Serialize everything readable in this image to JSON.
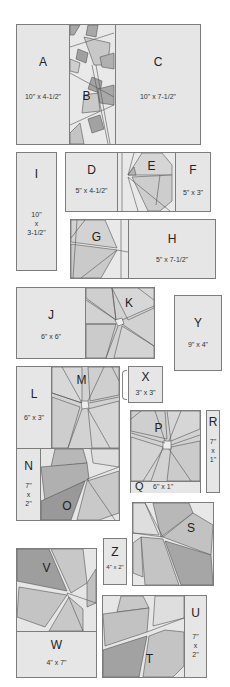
{
  "colors": {
    "plain_fabric": "#e6e6e6",
    "light_patch": "#d9d9d9",
    "mid_patch": "#c4c4c4",
    "dark_patch": "#a8a8a8",
    "darkest_patch": "#949494",
    "outline": "#7d7d7d"
  },
  "pieces": {
    "A": {
      "letter": "A",
      "size": "10\" x 4-1/2\""
    },
    "B": {
      "letter": "B"
    },
    "C": {
      "letter": "C",
      "size": "10\" x 7-1/2\""
    },
    "D": {
      "letter": "D",
      "size": "5\" x 4-1/2\""
    },
    "E": {
      "letter": "E"
    },
    "F": {
      "letter": "F",
      "size": "5\" x 3\""
    },
    "G": {
      "letter": "G"
    },
    "H": {
      "letter": "H",
      "size": "5\" x 7-1/2\""
    },
    "I": {
      "letter": "I",
      "size_line1": "10\"",
      "size_line2": "x",
      "size_line3": "3-1/2\""
    },
    "J": {
      "letter": "J",
      "size": "6\" x 6\""
    },
    "K": {
      "letter": "K"
    },
    "L": {
      "letter": "L",
      "size": "6\" x 3\""
    },
    "M": {
      "letter": "M"
    },
    "N": {
      "letter": "N",
      "size_line1": "7\"",
      "size_line2": "x",
      "size_line3": "2\""
    },
    "O": {
      "letter": "O"
    },
    "P": {
      "letter": "P"
    },
    "Q": {
      "letter": "Q",
      "size": "6\" x 1\""
    },
    "R": {
      "letter": "R",
      "size_line1": "7\"",
      "size_line2": "x",
      "size_line3": "1\""
    },
    "S": {
      "letter": "S"
    },
    "T": {
      "letter": "T"
    },
    "U": {
      "letter": "U",
      "size_line1": "7\"",
      "size_line2": "x",
      "size_line3": "2\""
    },
    "V": {
      "letter": "V"
    },
    "W": {
      "letter": "W",
      "size": "4\" x 7\""
    },
    "X": {
      "letter": "X",
      "size": "3\" x 3\""
    },
    "Y": {
      "letter": "Y",
      "size": "9\" x 4\""
    },
    "Z": {
      "letter": "Z",
      "size": "4\" x 2\""
    }
  }
}
